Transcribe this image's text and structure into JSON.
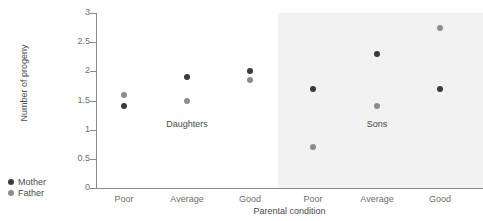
{
  "chart_data": {
    "type": "scatter",
    "title": "",
    "xlabel": "Parental condition",
    "ylabel": "Number of progeny",
    "ylim": [
      0,
      3
    ],
    "yticks": [
      0,
      0.5,
      1,
      1.5,
      2,
      2.5,
      3
    ],
    "ytick_labels": [
      "0",
      "0.5",
      "1",
      "1.5",
      "2",
      "2.5",
      "3"
    ],
    "grid": false,
    "legend_position": "bottom-left",
    "categories": [
      "Poor",
      "Average",
      "Good",
      "Poor",
      "Average",
      "Good"
    ],
    "panels": [
      {
        "name": "Daughters",
        "label": "Daughters",
        "shaded": false,
        "categories": [
          "Poor",
          "Average",
          "Good"
        ]
      },
      {
        "name": "Sons",
        "label": "Sons",
        "shaded": true,
        "categories": [
          "Poor",
          "Average",
          "Good"
        ]
      }
    ],
    "series": [
      {
        "name": "Mother",
        "color": "#3a3a3a",
        "values": [
          1.4,
          1.9,
          2.0,
          1.7,
          2.3,
          1.7
        ]
      },
      {
        "name": "Father",
        "color": "#8c8c8c",
        "values": [
          1.6,
          1.5,
          1.85,
          0.7,
          1.4,
          2.75
        ]
      }
    ],
    "points": [
      {
        "panel": "Daughters",
        "category": "Poor",
        "series": "Mother",
        "value": 1.4,
        "x_px": 124,
        "y_px": 106
      },
      {
        "panel": "Daughters",
        "category": "Poor",
        "series": "Father",
        "value": 1.6,
        "x_px": 124,
        "y_px": 95
      },
      {
        "panel": "Daughters",
        "category": "Average",
        "series": "Mother",
        "value": 1.9,
        "x_px": 187,
        "y_px": 77
      },
      {
        "panel": "Daughters",
        "category": "Average",
        "series": "Father",
        "value": 1.5,
        "x_px": 187,
        "y_px": 101
      },
      {
        "panel": "Daughters",
        "category": "Good",
        "series": "Mother",
        "value": 2.0,
        "x_px": 250,
        "y_px": 71
      },
      {
        "panel": "Daughters",
        "category": "Good",
        "series": "Father",
        "value": 1.85,
        "x_px": 250,
        "y_px": 83
      },
      {
        "panel": "Sons",
        "category": "Poor",
        "series": "Mother",
        "value": 1.7,
        "x_px": 313,
        "y_px": 89
      },
      {
        "panel": "Sons",
        "category": "Poor",
        "series": "Father",
        "value": 0.7,
        "x_px": 313,
        "y_px": 147
      },
      {
        "panel": "Sons",
        "category": "Average",
        "series": "Mother",
        "value": 2.3,
        "x_px": 377,
        "y_px": 54
      },
      {
        "panel": "Sons",
        "category": "Average",
        "series": "Father",
        "value": 1.4,
        "x_px": 377,
        "y_px": 106
      },
      {
        "panel": "Sons",
        "category": "Good",
        "series": "Mother",
        "value": 1.7,
        "x_px": 440,
        "y_px": 89
      },
      {
        "panel": "Sons",
        "category": "Good",
        "series": "Father",
        "value": 2.75,
        "x_px": 440,
        "y_px": 29
      }
    ],
    "legend": [
      {
        "label": "Mother",
        "color": "#3a3a3a"
      },
      {
        "label": "Father",
        "color": "#8c8c8c"
      }
    ],
    "colors": {
      "mother": "#3a3a3a",
      "father": "#8c8c8c",
      "axis": "#8a8a8a",
      "tick_text": "#6e6e6e",
      "label_text": "#4a4a4a",
      "panel_shade": "#f2f2f2",
      "background": "#ffffff"
    },
    "tick_px": {
      "y0": 188,
      "y3": 13,
      "x_positions": [
        124,
        187,
        250,
        313,
        377,
        440
      ]
    }
  }
}
